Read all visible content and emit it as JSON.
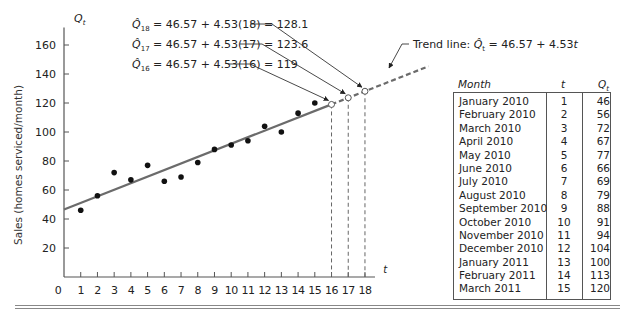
{
  "chart_data": {
    "type": "scatter",
    "title": "",
    "xlabel": "t",
    "ylabel": "Sales (homes serviced/month)",
    "y_axis_symbol": "Q_t",
    "xlim": [
      0,
      18
    ],
    "ylim": [
      0,
      170
    ],
    "x_ticks": [
      "0",
      "1",
      "2",
      "3",
      "4",
      "5",
      "6",
      "7",
      "8",
      "9",
      "10",
      "11",
      "12",
      "13",
      "14",
      "15",
      "16",
      "17",
      "18"
    ],
    "y_ticks": [
      "20",
      "40",
      "60",
      "80",
      "100",
      "120",
      "140",
      "160"
    ],
    "grid": false,
    "series": [
      {
        "name": "Actual sales",
        "style": "filled-dots",
        "x": [
          1,
          2,
          3,
          4,
          5,
          6,
          7,
          8,
          9,
          10,
          11,
          12,
          13,
          14,
          15
        ],
        "values": [
          46,
          56,
          72,
          67,
          77,
          66,
          69,
          79,
          88,
          91,
          94,
          104,
          100,
          113,
          120
        ]
      },
      {
        "name": "Trend line",
        "style": "solid line t=0..16, dashed beyond",
        "intercept": 46.57,
        "slope": 4.53
      },
      {
        "name": "Forecasts",
        "style": "open circles with dashed drop lines",
        "x": [
          16,
          17,
          18
        ],
        "values": [
          119,
          123.6,
          128.1
        ]
      }
    ],
    "annotations": [
      "Q̂18 = 46.57 + 4.53(18) = 128.1",
      "Q̂17 = 46.57 + 4.53(17) = 123.6",
      "Q̂16 = 46.57 + 4.53(16) = 119",
      "Trend line: Q̂t = 46.57 + 4.53t"
    ]
  },
  "axis": {
    "y_symbol": "Q",
    "y_symbol_sub": "t",
    "x_symbol": "t",
    "y_label": "Sales (homes serviced/month)",
    "origin_label": "0"
  },
  "annotations": {
    "q18": {
      "hat": "Q̂",
      "sub": "18",
      "rest": " = 46.57 + 4.53(18) = 128.1"
    },
    "q17": {
      "hat": "Q̂",
      "sub": "17",
      "rest": " = 46.57 + 4.53(17) = 123.6"
    },
    "q16": {
      "hat": "Q̂",
      "sub": "16",
      "rest": " = 46.57 + 4.53(16) = 119"
    },
    "trend": {
      "prefix": "Trend line: ",
      "hat": "Q̂",
      "sub": "t",
      "rest": " = 46.57 + 4.53",
      "var": "t"
    }
  },
  "table": {
    "headers": {
      "month": "Month",
      "t": "t",
      "q": "Q",
      "q_sub": "t"
    },
    "rows": [
      {
        "month": "January 2010",
        "t": "1",
        "q": "46"
      },
      {
        "month": "February 2010",
        "t": "2",
        "q": "56"
      },
      {
        "month": "March 2010",
        "t": "3",
        "q": "72"
      },
      {
        "month": "April 2010",
        "t": "4",
        "q": "67"
      },
      {
        "month": "May 2010",
        "t": "5",
        "q": "77"
      },
      {
        "month": "June 2010",
        "t": "6",
        "q": "66"
      },
      {
        "month": "July 2010",
        "t": "7",
        "q": "69"
      },
      {
        "month": "August 2010",
        "t": "8",
        "q": "79"
      },
      {
        "month": "September 2010",
        "t": "9",
        "q": "88"
      },
      {
        "month": "October 2010",
        "t": "10",
        "q": "91"
      },
      {
        "month": "November 2010",
        "t": "11",
        "q": "94"
      },
      {
        "month": "December 2010",
        "t": "12",
        "q": "104"
      },
      {
        "month": "January 2011",
        "t": "13",
        "q": "100"
      },
      {
        "month": "February 2011",
        "t": "14",
        "q": "113"
      },
      {
        "month": "March 2011",
        "t": "15",
        "q": "120"
      }
    ]
  },
  "colors": {
    "line": "#6b6b6b",
    "dots": "#111111",
    "text": "#222222"
  }
}
